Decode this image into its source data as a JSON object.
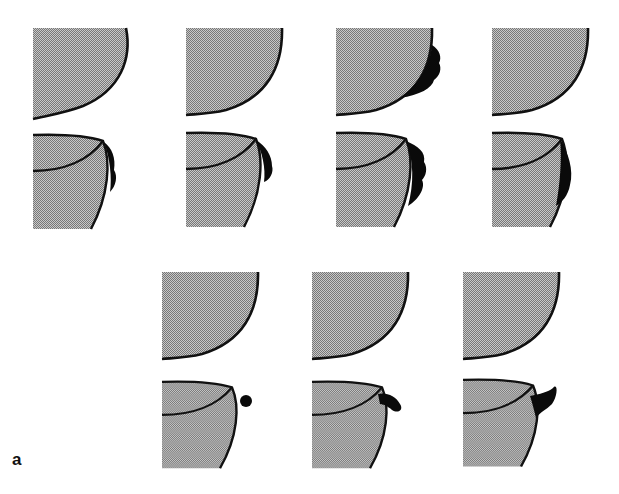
{
  "figure": {
    "panel_label": "a",
    "colors": {
      "fill": "#a9a9a9",
      "outline": "#111111",
      "deposit": "#0a0a0a",
      "background": "#ffffff"
    },
    "groups": [
      {
        "name": "row-1",
        "columns": 4,
        "panels_per_column": [
          "profile-view",
          "perspective-view"
        ]
      },
      {
        "name": "row-2",
        "columns": 3,
        "panels_per_column": [
          "profile-view",
          "perspective-view"
        ]
      }
    ],
    "panels": [
      {
        "id": "r1c1-top",
        "view": "profile",
        "deposit": "none"
      },
      {
        "id": "r1c1-bottom",
        "view": "perspective",
        "deposit": "thin-edge"
      },
      {
        "id": "r1c2-top",
        "view": "profile",
        "deposit": "none"
      },
      {
        "id": "r1c2-bottom",
        "view": "perspective",
        "deposit": "thin-edge"
      },
      {
        "id": "r1c3-top",
        "view": "profile",
        "deposit": "lumpy-edge"
      },
      {
        "id": "r1c3-bottom",
        "view": "perspective",
        "deposit": "lumpy-edge"
      },
      {
        "id": "r1c4-top",
        "view": "profile",
        "deposit": "none"
      },
      {
        "id": "r1c4-bottom",
        "view": "perspective",
        "deposit": "thick-edge"
      },
      {
        "id": "r2c1-top",
        "view": "profile",
        "deposit": "none"
      },
      {
        "id": "r2c1-bottom",
        "view": "perspective",
        "deposit": "small-bulb"
      },
      {
        "id": "r2c2-top",
        "view": "profile",
        "deposit": "none"
      },
      {
        "id": "r2c2-bottom",
        "view": "perspective",
        "deposit": "bulb-horn"
      },
      {
        "id": "r2c3-top",
        "view": "profile",
        "deposit": "none"
      },
      {
        "id": "r2c3-bottom",
        "view": "perspective",
        "deposit": "horn"
      }
    ]
  }
}
